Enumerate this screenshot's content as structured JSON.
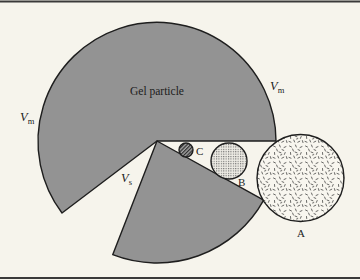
{
  "figure": {
    "labels": {
      "gel_particle": "Gel particle",
      "vm_right": {
        "main": "V",
        "sub": "m"
      },
      "vm_left": {
        "main": "V",
        "sub": "m"
      },
      "vs": {
        "main": "V",
        "sub": "s"
      },
      "molecule_a": "A",
      "molecule_b": "B",
      "molecule_c": "C"
    },
    "elements": {
      "gel_matrix_sector": {
        "description": "Large shaded gel matrix region (V_m)"
      },
      "gel_lower_sector": {
        "description": "Lower shaded gel matrix region"
      },
      "pore_wedge": {
        "description": "Unshaded wedge-shaped pore region (V_s)"
      },
      "molecule_a": {
        "size": "large",
        "pattern": "random dashes",
        "position": "outside pore"
      },
      "molecule_b": {
        "size": "medium",
        "pattern": "cross-hatch",
        "position": "partially inside pore"
      },
      "molecule_c": {
        "size": "small",
        "pattern": "dark diagonal hatch",
        "position": "deep inside pore"
      }
    }
  },
  "colors": {
    "background": "#f6f4ec",
    "gel_fill": "#939393",
    "outline": "#1e1e1e",
    "text": "#1c1c1c"
  }
}
